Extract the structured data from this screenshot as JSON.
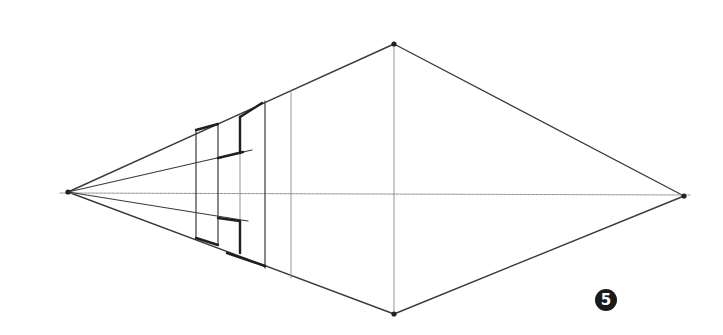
{
  "figure": {
    "step_number": "5",
    "colors": {
      "stroke": "#3a3a3a",
      "light_stroke": "#8a8a8a",
      "background": "#ffffff",
      "badge": "#1a1a1a"
    }
  },
  "points": {
    "left_vp": [
      68,
      192
    ],
    "right_vp": [
      684,
      196
    ],
    "top": [
      394,
      44
    ],
    "bottom": [
      394,
      314
    ]
  },
  "lines": {
    "diamond": [
      [
        [
          68,
          192
        ],
        [
          394,
          44
        ]
      ],
      [
        [
          394,
          44
        ],
        [
          684,
          196
        ]
      ],
      [
        [
          684,
          196
        ],
        [
          394,
          314
        ]
      ],
      [
        [
          394,
          314
        ],
        [
          68,
          192
        ]
      ]
    ],
    "horizon": [
      [
        60,
        193
      ],
      [
        690,
        195
      ]
    ],
    "center_vertical": [
      [
        394,
        44
      ],
      [
        394,
        314
      ]
    ],
    "rays": [
      [
        [
          68,
          192
        ],
        [
          252,
          150
        ]
      ],
      [
        [
          68,
          192
        ],
        [
          248,
          221
        ]
      ]
    ],
    "verticals": [
      {
        "x": 196,
        "y1": 130,
        "y2": 238,
        "weight": "medium"
      },
      {
        "x": 218,
        "y1": 124,
        "y2": 245,
        "weight": "medium"
      },
      {
        "x": 240,
        "y1": 116,
        "y2": 220,
        "weight": "light"
      },
      {
        "x": 265,
        "y1": 101,
        "y2": 268,
        "weight": "medium"
      },
      {
        "x": 291,
        "y1": 90,
        "y2": 278,
        "weight": "light"
      }
    ],
    "bold_segments": [
      [
        [
          196,
          130
        ],
        [
          218,
          124
        ]
      ],
      [
        [
          240,
          117
        ],
        [
          262,
          103
        ]
      ],
      [
        [
          240,
          117
        ],
        [
          240,
          153
        ]
      ],
      [
        [
          218,
          158
        ],
        [
          243,
          152
        ]
      ],
      [
        [
          218,
          218
        ],
        [
          240,
          221
        ]
      ],
      [
        [
          240,
          221
        ],
        [
          240,
          253
        ]
      ],
      [
        [
          218,
          245
        ],
        [
          196,
          238
        ]
      ],
      [
        [
          227,
          253
        ],
        [
          265,
          266
        ]
      ]
    ]
  },
  "badge": {
    "label": "5",
    "x": 595,
    "y": 289
  }
}
